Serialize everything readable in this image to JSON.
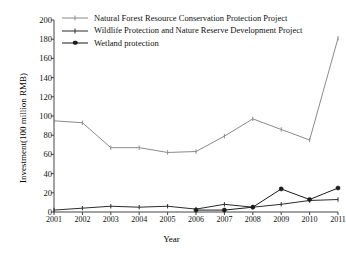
{
  "chart_data": {
    "type": "line",
    "title": "",
    "xlabel": "Year",
    "ylabel": "Investment(100 million RMB)",
    "categories": [
      "2001",
      "2002",
      "2003",
      "2004",
      "2005",
      "2006",
      "2007",
      "2008",
      "2009",
      "2010",
      "2011"
    ],
    "x": [
      2001,
      2002,
      2003,
      2004,
      2005,
      2006,
      2007,
      2008,
      2009,
      2010,
      2011
    ],
    "ylim": [
      0,
      200
    ],
    "yticks": [
      0,
      20,
      40,
      60,
      80,
      100,
      120,
      140,
      160,
      180,
      200
    ],
    "grid": false,
    "legend_position": "top-left",
    "series": [
      {
        "name": "Natural Forest Resource Conservation Protection Project",
        "color": "#8a8a8a",
        "marker": "tick",
        "values": [
          95,
          93,
          67,
          67,
          62,
          63,
          79,
          97,
          86,
          75,
          181
        ]
      },
      {
        "name": "Wildlife Protection and Nature Reserve Development Project",
        "color": "#2b2b2b",
        "marker": "tick",
        "values": [
          2,
          4,
          6,
          5,
          6,
          3,
          8,
          5,
          8,
          12,
          13
        ]
      },
      {
        "name": "Wetland protection",
        "color": "#1a1a1a",
        "marker": "circle",
        "values": [
          null,
          null,
          null,
          null,
          null,
          2,
          2,
          5,
          24,
          13,
          25
        ]
      }
    ]
  },
  "legend": {
    "items": [
      {
        "label": "Natural Forest Resource Conservation Protection Project"
      },
      {
        "label": "Wildlife Protection and Nature Reserve Development Project"
      },
      {
        "label": "Wetland protection"
      }
    ]
  },
  "axes": {
    "y_title": "Investment(100 million RMB)",
    "x_title": "Year",
    "y_ticks": [
      "0",
      "20",
      "40",
      "60",
      "80",
      "100",
      "120",
      "140",
      "160",
      "180",
      "200"
    ],
    "x_ticks": [
      "2001",
      "2002",
      "2003",
      "2004",
      "2005",
      "2006",
      "2007",
      "2008",
      "2009",
      "2010",
      "2011"
    ]
  }
}
